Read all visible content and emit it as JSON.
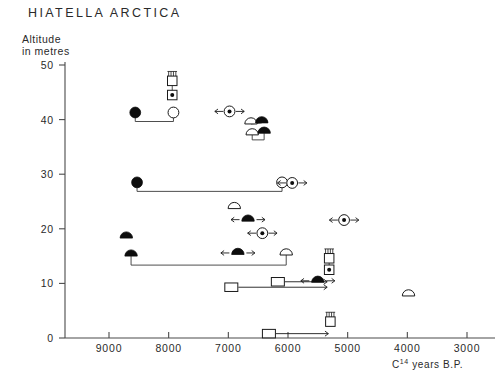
{
  "chart_data": {
    "type": "scatter",
    "title": "HIATELLA ARCTICA",
    "ylabel_line1": "Altitude",
    "ylabel_line2": "in metres",
    "xlabel": "C14 years B.P.",
    "xlabel_base": "C",
    "xlabel_sup": "14",
    "xlabel_rest": " years B.P.",
    "xlim": [
      9500,
      3000
    ],
    "ylim": [
      0,
      50
    ],
    "x_reversed": true,
    "xticks": [
      9000,
      8000,
      7000,
      6000,
      5000,
      4000,
      3000
    ],
    "xticklabels": [
      "9000",
      "8000",
      "7000",
      "6000",
      "5000",
      "4000",
      "3000"
    ],
    "yticks": [
      0,
      10,
      20,
      30,
      40,
      50
    ],
    "yticklabels": [
      "0",
      "10",
      "20",
      "30",
      "40",
      "50"
    ],
    "grid": false,
    "legend": "none",
    "symbol_types": {
      "filled-circle": "closed circle sample",
      "open-circle": "open circle sample",
      "filled-half-circle": "filled semicircle sample",
      "open-half-circle": "open semicircle sample",
      "open-square": "open square sample",
      "dot-square": "square with central dot",
      "hatched-square": "square with hatching above",
      "arrow-circle": "circle with left and right arrows",
      "arrow-half-circle": "semicircle with left and right arrows"
    },
    "points": [
      {
        "id": "p01",
        "symbol": "hatched-square",
        "x": 7940,
        "y": 47.1
      },
      {
        "id": "p02",
        "symbol": "dot-square",
        "x": 7940,
        "y": 44.5
      },
      {
        "id": "p03",
        "symbol": "filled-circle",
        "x": 8560,
        "y": 41.3
      },
      {
        "id": "p04",
        "symbol": "open-circle",
        "x": 7920,
        "y": 41.3
      },
      {
        "id": "p05",
        "symbol": "arrow-circle",
        "x": 6980,
        "y": 41.5
      },
      {
        "id": "p06",
        "symbol": "open-half-circle",
        "x": 6620,
        "y": 39.2
      },
      {
        "id": "p07",
        "symbol": "filled-half-circle",
        "x": 6440,
        "y": 39.4
      },
      {
        "id": "p08",
        "symbol": "open-half-circle",
        "x": 6600,
        "y": 37.2
      },
      {
        "id": "p09",
        "symbol": "filled-half-circle",
        "x": 6400,
        "y": 37.5
      },
      {
        "id": "p10",
        "symbol": "filled-circle",
        "x": 8530,
        "y": 28.5
      },
      {
        "id": "p11",
        "symbol": "open-circle",
        "x": 6100,
        "y": 28.5
      },
      {
        "id": "p12",
        "symbol": "arrow-circle",
        "x": 5930,
        "y": 28.4
      },
      {
        "id": "p13",
        "symbol": "open-half-circle",
        "x": 6900,
        "y": 23.7
      },
      {
        "id": "p14",
        "symbol": "arrow-half-circle",
        "x": 6670,
        "y": 21.4
      },
      {
        "id": "p15",
        "symbol": "arrow-circle",
        "x": 5060,
        "y": 21.6
      },
      {
        "id": "p16",
        "symbol": "filled-half-circle",
        "x": 8710,
        "y": 18.3
      },
      {
        "id": "p17",
        "symbol": "arrow-circle",
        "x": 6430,
        "y": 19.2
      },
      {
        "id": "p18",
        "symbol": "filled-half-circle",
        "x": 8630,
        "y": 15.0
      },
      {
        "id": "p19",
        "symbol": "arrow-half-circle",
        "x": 6840,
        "y": 15.3
      },
      {
        "id": "p20",
        "symbol": "open-half-circle",
        "x": 6030,
        "y": 15.2
      },
      {
        "id": "p21",
        "symbol": "hatched-square",
        "x": 5310,
        "y": 14.6
      },
      {
        "id": "p22",
        "symbol": "dot-square",
        "x": 5310,
        "y": 12.5
      },
      {
        "id": "p23",
        "symbol": "open-square",
        "x": 6170,
        "y": 10.3
      },
      {
        "id": "p24",
        "symbol": "arrow-half-circle",
        "x": 5500,
        "y": 10.2
      },
      {
        "id": "p25",
        "symbol": "open-square",
        "x": 6950,
        "y": 9.3
      },
      {
        "id": "p26",
        "symbol": "open-half-circle",
        "x": 3980,
        "y": 7.7
      },
      {
        "id": "p27",
        "symbol": "hatched-square",
        "x": 5290,
        "y": 3.0
      },
      {
        "id": "p28",
        "symbol": "open-square",
        "x": 6320,
        "y": 0.8
      }
    ],
    "connections": [
      {
        "from": "p01",
        "to": "p02",
        "style": "vertical"
      },
      {
        "from": "p03",
        "to": "p04",
        "style": "bracket-down"
      },
      {
        "from": "p10",
        "to": "p11",
        "style": "bracket-down"
      },
      {
        "from": "p06",
        "to": "p07",
        "style": "horizontal"
      },
      {
        "from": "p08",
        "to": "p09",
        "style": "bracket"
      },
      {
        "from": "p18",
        "to": "p20",
        "style": "bracket-down"
      },
      {
        "from": "p25",
        "to": "p21",
        "style": "arrow-right"
      },
      {
        "from": "p23",
        "to": "p21",
        "style": "arrow-right"
      },
      {
        "from": "p28",
        "to": "p27",
        "style": "arrow-right"
      },
      {
        "from": "p21",
        "to": "p22",
        "style": "vertical"
      }
    ]
  }
}
